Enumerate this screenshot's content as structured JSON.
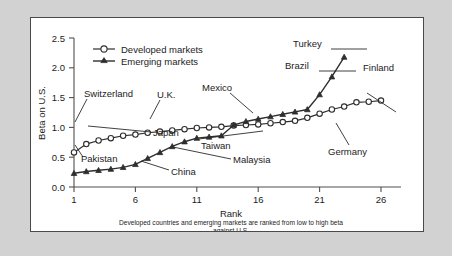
{
  "figure": {
    "panel_background": "#ffffff",
    "outer_background": "#d2d2d2",
    "border_color": "#4a4a4a",
    "ink_color": "#2e2e2e"
  },
  "chart_data": {
    "type": "line",
    "title": "",
    "xlabel": "Rank",
    "ylabel": "Beta on U.S.",
    "xlim": [
      1,
      26
    ],
    "ylim": [
      0.0,
      2.5
    ],
    "xticks": [
      1,
      6,
      11,
      16,
      21,
      26
    ],
    "yticks": [
      "0.0",
      "0.5",
      "1.0",
      "1.5",
      "2.0",
      "2.5"
    ],
    "ytick_values": [
      0.0,
      0.5,
      1.0,
      1.5,
      2.0,
      2.5
    ],
    "grid": false,
    "legend_position": "upper-left-inside",
    "caption_line1": "Developed countries and emerging markets are ranked from low to high beta",
    "caption_line2": "against U.S.",
    "series": [
      {
        "name": "Developed markets",
        "marker": "open-circle",
        "x": [
          1,
          2,
          3,
          4,
          5,
          6,
          7,
          8,
          9,
          10,
          11,
          12,
          13,
          14,
          15,
          16,
          17,
          18,
          19,
          20,
          21,
          22,
          23,
          24,
          25,
          26
        ],
        "values": [
          0.58,
          0.72,
          0.78,
          0.82,
          0.86,
          0.88,
          0.91,
          0.93,
          0.95,
          0.97,
          0.99,
          1.0,
          1.01,
          1.03,
          1.04,
          1.05,
          1.07,
          1.09,
          1.11,
          1.16,
          1.23,
          1.3,
          1.35,
          1.42,
          1.43,
          1.45
        ]
      },
      {
        "name": "Emerging markets",
        "marker": "filled-triangle",
        "x": [
          1,
          2,
          3,
          4,
          5,
          6,
          7,
          8,
          9,
          10,
          11,
          12,
          13,
          14,
          15,
          16,
          17,
          18,
          19,
          20,
          21,
          22,
          23
        ],
        "values": [
          0.23,
          0.26,
          0.28,
          0.3,
          0.33,
          0.38,
          0.48,
          0.58,
          0.68,
          0.76,
          0.82,
          0.84,
          0.86,
          1.04,
          1.1,
          1.14,
          1.18,
          1.22,
          1.26,
          1.3,
          1.55,
          1.85,
          2.18
        ]
      }
    ],
    "annotations": [
      {
        "label": "Switzerland",
        "series": "Developed markets",
        "rank": 1,
        "beta": 0.58
      },
      {
        "label": "U.K.",
        "series": "Developed markets",
        "rank": 8,
        "beta": 0.93
      },
      {
        "label": "Mexico",
        "series": "Emerging markets",
        "rank": 14,
        "beta": 1.04
      },
      {
        "label": "Turkey",
        "series": "Emerging markets",
        "rank": 23,
        "beta": 2.18
      },
      {
        "label": "Brazil",
        "series": "Emerging markets",
        "rank": 22,
        "beta": 1.85
      },
      {
        "label": "Finland",
        "series": "Developed markets",
        "rank": 26,
        "beta": 1.45
      },
      {
        "label": "Germany",
        "series": "Developed markets",
        "rank": 21,
        "beta": 1.23
      },
      {
        "label": "Japan",
        "series": "Developed markets",
        "rank": 2,
        "beta": 0.72
      },
      {
        "label": "Pakistan",
        "series": "Emerging markets",
        "rank": 1,
        "beta": 0.23
      },
      {
        "label": "China",
        "series": "Emerging markets",
        "rank": 4,
        "beta": 0.3
      },
      {
        "label": "Malaysia",
        "series": "Emerging markets",
        "rank": 9,
        "beta": 0.68
      },
      {
        "label": "Taiwan",
        "series": "Emerging markets",
        "rank": 14,
        "beta": 1.04
      }
    ]
  },
  "legend": {
    "items": [
      {
        "label": "Developed markets",
        "marker": "open-circle"
      },
      {
        "label": "Emerging markets",
        "marker": "filled-triangle"
      }
    ]
  },
  "axes": {
    "y_title": "Beta on U.S.",
    "x_title": "Rank",
    "y_tick_labels": [
      "2.5",
      "2.0",
      "1.5",
      "1.0",
      "0.5",
      "0.0"
    ],
    "x_tick_labels": [
      "1",
      "6",
      "11",
      "16",
      "21",
      "26"
    ]
  },
  "annotation_labels": {
    "switzerland": "Switzerland",
    "uk": "U.K.",
    "mexico": "Mexico",
    "turkey": "Turkey",
    "brazil": "Brazil",
    "finland": "Finland",
    "germany": "Germany",
    "japan": "Japan",
    "pakistan": "Pakistan",
    "china": "China",
    "malaysia": "Malaysia",
    "taiwan": "Taiwan"
  },
  "caption": {
    "line1": "Developed countries and emerging markets are ranked from low to high beta",
    "line2": "against U.S."
  }
}
